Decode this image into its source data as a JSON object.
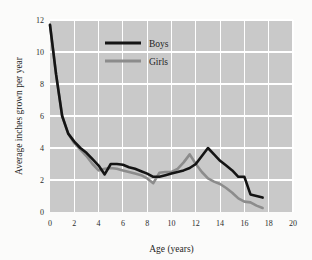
{
  "chart_data": {
    "type": "line",
    "title": "",
    "xlabel": "Age (years)",
    "ylabel": "Average inches grown per year",
    "xlim": [
      0,
      20
    ],
    "ylim": [
      0,
      12
    ],
    "xticks": [
      0,
      2,
      4,
      6,
      8,
      10,
      12,
      14,
      16,
      18,
      20
    ],
    "yticks": [
      0,
      2,
      4,
      6,
      8,
      10,
      12
    ],
    "grid": true,
    "legend_position": "top-center-inside",
    "plot_background_color": "#c9c9c9",
    "figure_background_color": "#fbfbfa",
    "gridline_color": "#ffffff",
    "series": [
      {
        "name": "Boys",
        "color": "#141414",
        "line_width": 2.6,
        "x": [
          0,
          0.5,
          1,
          1.5,
          2,
          2.5,
          3,
          3.5,
          4,
          4.5,
          5,
          5.5,
          6,
          6.5,
          7,
          7.5,
          8,
          8.5,
          9,
          9.5,
          10,
          10.5,
          11,
          11.5,
          12,
          12.5,
          13,
          13.5,
          14,
          14.5,
          15,
          15.5,
          16,
          16.5,
          17,
          17.5
        ],
        "y": [
          11.7,
          8.6,
          6.0,
          4.9,
          4.4,
          4.0,
          3.7,
          3.3,
          2.9,
          2.35,
          3.0,
          3.0,
          2.95,
          2.8,
          2.7,
          2.55,
          2.4,
          2.2,
          2.2,
          2.3,
          2.4,
          2.5,
          2.6,
          2.75,
          3.0,
          3.5,
          4.0,
          3.6,
          3.2,
          2.9,
          2.6,
          2.2,
          2.2,
          1.1,
          1.0,
          0.9
        ]
      },
      {
        "name": "Girls",
        "color": "#8c8c8c",
        "line_width": 2.6,
        "x": [
          0,
          0.5,
          1,
          1.5,
          2,
          2.5,
          3,
          3.5,
          4,
          4.5,
          5,
          5.5,
          6,
          6.5,
          7,
          7.5,
          8,
          8.5,
          9,
          9.5,
          10,
          10.5,
          11,
          11.5,
          12,
          12.5,
          13,
          13.5,
          14,
          14.5,
          15,
          15.5,
          16,
          16.5,
          17,
          17.5
        ],
        "y": [
          11.7,
          8.6,
          6.0,
          4.9,
          4.3,
          3.9,
          3.5,
          3.0,
          2.6,
          2.7,
          2.75,
          2.7,
          2.6,
          2.5,
          2.4,
          2.3,
          2.1,
          1.8,
          2.45,
          2.5,
          2.5,
          2.7,
          3.1,
          3.6,
          3.0,
          2.5,
          2.1,
          1.9,
          1.75,
          1.5,
          1.2,
          0.85,
          0.65,
          0.6,
          0.4,
          0.25
        ]
      }
    ]
  },
  "legend": {
    "entries": [
      {
        "label": "Boys",
        "color": "#141414"
      },
      {
        "label": "Girls",
        "color": "#8c8c8c"
      }
    ]
  },
  "axes": {
    "x_title": "Age (years)",
    "y_title": "Average inches grown per year",
    "x_tick_labels": [
      "0",
      "2",
      "4",
      "6",
      "8",
      "10",
      "12",
      "14",
      "16",
      "18",
      "20"
    ],
    "y_tick_labels": [
      "0",
      "2",
      "4",
      "6",
      "8",
      "10",
      "12"
    ]
  }
}
